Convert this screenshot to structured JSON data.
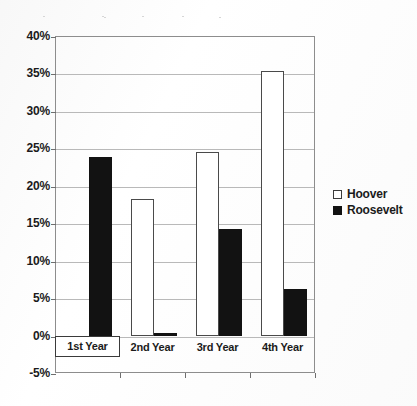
{
  "chart_data": {
    "type": "bar",
    "title": "",
    "subtitle": "",
    "xlabel": "",
    "ylabel": "",
    "categories": [
      "1st Year",
      "2nd Year",
      "3rd Year",
      "4th Year"
    ],
    "series": [
      {
        "name": "Hoover",
        "values": [
          0,
          18.2,
          24.5,
          35.3
        ],
        "fill": "#ffffff",
        "stroke": "#4a4a4a"
      },
      {
        "name": "Roosevelt",
        "values": [
          23.8,
          0.4,
          14.2,
          6.2
        ],
        "fill": "#121212",
        "stroke": "#121212"
      }
    ],
    "ylim": [
      -5,
      40
    ],
    "ytick_step": 5,
    "ytick_labels": [
      "40%",
      "35%",
      "30%",
      "25%",
      "20%",
      "15%",
      "10%",
      "5%",
      "0%",
      "-5%"
    ],
    "ytick_values": [
      40,
      35,
      30,
      25,
      20,
      15,
      10,
      5,
      0,
      -5
    ],
    "grid": true,
    "legend_position": "right",
    "value_suffix": "%",
    "selected_category": "1st Year"
  },
  "legend": {
    "entries": [
      {
        "label": "Hoover",
        "swatch": "hollow-square-icon"
      },
      {
        "label": "Roosevelt",
        "swatch": "filled-square-icon"
      }
    ]
  }
}
